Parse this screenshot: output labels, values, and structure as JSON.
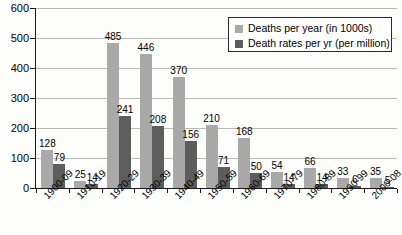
{
  "chart_data": {
    "type": "bar",
    "title": "",
    "xlabel": "",
    "ylabel": "",
    "ylim": [
      0,
      600
    ],
    "yticks": [
      0,
      100,
      200,
      300,
      400,
      500,
      600
    ],
    "grid": true,
    "legend_position": "top-right",
    "categories": [
      "1900-09",
      "1910-19",
      "1920-29",
      "1930-39",
      "1940-49",
      "1950-59",
      "1960-69",
      "1970-79",
      "1980-89",
      "1990-99",
      "2000-08"
    ],
    "series": [
      {
        "name": "Deaths per year (in 1000s)",
        "color": "#a9a9a9",
        "values": [
          128,
          25,
          485,
          446,
          370,
          210,
          168,
          54,
          66,
          33,
          35
        ]
      },
      {
        "name": "Death rates per yr (per million)",
        "color": "#5d5d5d",
        "values": [
          79,
          14,
          241,
          208,
          156,
          71,
          50,
          14,
          14,
          6,
          5
        ]
      }
    ]
  },
  "legend": {
    "items": [
      {
        "label": "Deaths per year (in 1000s)",
        "swatch": "deaths"
      },
      {
        "label": "Death rates per yr (per million)",
        "swatch": "rates"
      }
    ]
  }
}
